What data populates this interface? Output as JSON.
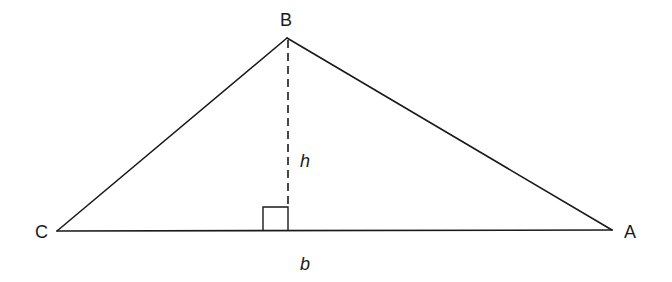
{
  "diagram": {
    "title": "",
    "type": "triangle-area",
    "vertices": [
      {
        "name": "A",
        "label": "A",
        "x": 612,
        "y": 230
      },
      {
        "name": "B",
        "label": "B",
        "x": 287,
        "y": 38
      },
      {
        "name": "C",
        "label": "C",
        "x": 57,
        "y": 231
      }
    ],
    "altitude": {
      "label": "h",
      "from": "B",
      "foot": {
        "x": 288,
        "y": 231
      },
      "style": "dashed"
    },
    "base": {
      "label": "b",
      "from": "C",
      "to": "A"
    },
    "right_angle_marker": {
      "x": 263,
      "y": 207,
      "size": 25
    },
    "colors": {
      "stroke": "#1a1a1a",
      "background": "#ffffff"
    }
  }
}
